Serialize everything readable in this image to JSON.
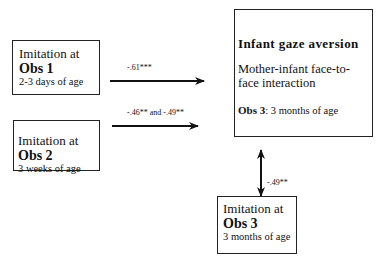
{
  "diagram": {
    "boxes": [
      {
        "id": "obs1",
        "line1": "Imitation at",
        "line2": "Obs 1",
        "line3": "2-3 days of age"
      },
      {
        "id": "obs2",
        "line1": "Imitation at",
        "line2": "Obs 2",
        "line3": "3 weeks of age"
      },
      {
        "id": "obs3",
        "line1": "Imitation at",
        "line2": "Obs 3",
        "line3": "3 months of age"
      }
    ],
    "outcome": {
      "title": "Infant gaze aversion",
      "description": "Mother-infant face-to-face interaction",
      "obs_label": "Obs 3",
      "obs_text": ": 3 months of age"
    },
    "edges": [
      {
        "from": "obs1",
        "to": "outcome",
        "label": "-.61***"
      },
      {
        "from": "obs2",
        "to": "outcome",
        "label": "-.46** and -.49**"
      },
      {
        "from": "obs3",
        "to": "outcome",
        "label": "-.49**",
        "bidirectional": true
      }
    ]
  }
}
